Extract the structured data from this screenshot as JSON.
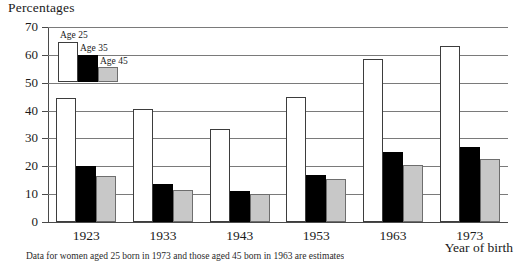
{
  "chart_data": {
    "type": "bar",
    "title": "Percentages",
    "xlabel": "Year of birth",
    "ylabel": "",
    "ylim": [
      0,
      70
    ],
    "yticks": [
      0,
      10,
      20,
      30,
      40,
      50,
      60,
      70
    ],
    "ytick_labels": [
      "0",
      "10",
      "20",
      "30",
      "40",
      "50",
      "60",
      "70"
    ],
    "grid": true,
    "legend_position": "top-left",
    "categories": [
      "1923",
      "1933",
      "1943",
      "1953",
      "1963",
      "1973"
    ],
    "series": [
      {
        "name": "Age 25",
        "color": "#ffffff",
        "values": [
          44.5,
          40.5,
          33.5,
          45.0,
          58.5,
          63.0
        ]
      },
      {
        "name": "Age 35",
        "color": "#000000",
        "values": [
          20.0,
          13.5,
          11.0,
          17.0,
          25.0,
          27.0
        ]
      },
      {
        "name": "Age 45",
        "color": "#c8c8c8",
        "values": [
          16.5,
          11.5,
          10.0,
          15.5,
          20.5,
          22.5
        ]
      }
    ],
    "footnote": "Data for women aged 25 born in 1973 and those aged 45 born in 1963 are estimates"
  }
}
